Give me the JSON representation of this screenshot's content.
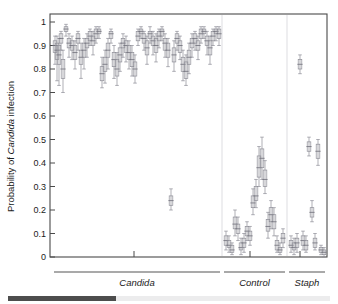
{
  "figure": {
    "axis": {
      "ylabel_prefix": "Probability of ",
      "ylabel_italic": "Candida",
      "ylabel_suffix": " infection",
      "yticks": [
        "1",
        "0.9",
        "0.8",
        "0.7",
        "0.6",
        "0.5",
        "0.4",
        "0.3",
        "0.2",
        "0.1",
        "0"
      ]
    },
    "groups": [
      {
        "name": "Candida",
        "label": "Candida"
      },
      {
        "name": "Control",
        "label": "Control"
      },
      {
        "name": "Staph",
        "label": "Staph"
      }
    ]
  },
  "chart_data": {
    "type": "scatter",
    "title": "",
    "xlabel": "",
    "ylabel": "Probability of Candida infection",
    "ylim": [
      0,
      1
    ],
    "yticks": [
      0,
      0.1,
      0.2,
      0.3,
      0.4,
      0.5,
      0.6,
      0.7,
      0.8,
      0.9,
      1
    ],
    "grid": false,
    "legend": "none",
    "marker_style": "box-and-whisker (median with 95% credible interval)",
    "group_separators_x": [
      222,
      287
    ],
    "groups": [
      {
        "name": "Candida",
        "label": "Candida",
        "n": 95,
        "x_start": 54,
        "x_end": 220,
        "series": [
          {
            "x": 55,
            "median": 0.9,
            "lo": 0.82,
            "hi": 0.94,
            "q1": 0.87,
            "q3": 0.92
          },
          {
            "x": 57,
            "median": 0.88,
            "lo": 0.75,
            "hi": 0.94,
            "q1": 0.84,
            "q3": 0.91
          },
          {
            "x": 59,
            "median": 0.86,
            "lo": 0.73,
            "hi": 0.93,
            "q1": 0.82,
            "q3": 0.9
          },
          {
            "x": 61,
            "median": 0.93,
            "lo": 0.88,
            "hi": 0.96,
            "q1": 0.91,
            "q3": 0.95
          },
          {
            "x": 63,
            "median": 0.8,
            "lo": 0.7,
            "hi": 0.88,
            "q1": 0.76,
            "q3": 0.84
          },
          {
            "x": 66,
            "median": 0.97,
            "lo": 0.94,
            "hi": 0.99,
            "q1": 0.96,
            "q3": 0.98
          },
          {
            "x": 69,
            "median": 0.91,
            "lo": 0.85,
            "hi": 0.95,
            "q1": 0.89,
            "q3": 0.93
          },
          {
            "x": 72,
            "median": 0.9,
            "lo": 0.84,
            "hi": 0.94,
            "q1": 0.88,
            "q3": 0.92
          },
          {
            "x": 75,
            "median": 0.87,
            "lo": 0.8,
            "hi": 0.92,
            "q1": 0.84,
            "q3": 0.9
          },
          {
            "x": 78,
            "median": 0.93,
            "lo": 0.88,
            "hi": 0.96,
            "q1": 0.91,
            "q3": 0.95
          },
          {
            "x": 81,
            "median": 0.85,
            "lo": 0.76,
            "hi": 0.91,
            "q1": 0.82,
            "q3": 0.88
          },
          {
            "x": 84,
            "median": 0.88,
            "lo": 0.8,
            "hi": 0.93,
            "q1": 0.85,
            "q3": 0.91
          },
          {
            "x": 87,
            "median": 0.91,
            "lo": 0.85,
            "hi": 0.95,
            "q1": 0.89,
            "q3": 0.93
          },
          {
            "x": 90,
            "median": 0.94,
            "lo": 0.9,
            "hi": 0.97,
            "q1": 0.92,
            "q3": 0.96
          },
          {
            "x": 93,
            "median": 0.92,
            "lo": 0.86,
            "hi": 0.96,
            "q1": 0.9,
            "q3": 0.94
          },
          {
            "x": 96,
            "median": 0.95,
            "lo": 0.91,
            "hi": 0.98,
            "q1": 0.93,
            "q3": 0.97
          },
          {
            "x": 99,
            "median": 0.96,
            "lo": 0.93,
            "hi": 0.98,
            "q1": 0.95,
            "q3": 0.97
          },
          {
            "x": 102,
            "median": 0.78,
            "lo": 0.72,
            "hi": 0.85,
            "q1": 0.75,
            "q3": 0.81
          },
          {
            "x": 105,
            "median": 0.82,
            "lo": 0.74,
            "hi": 0.88,
            "q1": 0.79,
            "q3": 0.85
          },
          {
            "x": 108,
            "median": 0.88,
            "lo": 0.8,
            "hi": 0.93,
            "q1": 0.85,
            "q3": 0.91
          },
          {
            "x": 111,
            "median": 0.95,
            "lo": 0.91,
            "hi": 0.97,
            "q1": 0.93,
            "q3": 0.96
          },
          {
            "x": 114,
            "median": 0.84,
            "lo": 0.76,
            "hi": 0.9,
            "q1": 0.81,
            "q3": 0.87
          },
          {
            "x": 117,
            "median": 0.8,
            "lo": 0.73,
            "hi": 0.87,
            "q1": 0.77,
            "q3": 0.84
          },
          {
            "x": 120,
            "median": 0.86,
            "lo": 0.79,
            "hi": 0.91,
            "q1": 0.83,
            "q3": 0.89
          },
          {
            "x": 123,
            "median": 0.91,
            "lo": 0.85,
            "hi": 0.95,
            "q1": 0.89,
            "q3": 0.93
          },
          {
            "x": 126,
            "median": 0.9,
            "lo": 0.83,
            "hi": 0.94,
            "q1": 0.87,
            "q3": 0.92
          },
          {
            "x": 129,
            "median": 0.87,
            "lo": 0.8,
            "hi": 0.92,
            "q1": 0.84,
            "q3": 0.9
          },
          {
            "x": 132,
            "median": 0.84,
            "lo": 0.77,
            "hi": 0.9,
            "q1": 0.81,
            "q3": 0.87
          },
          {
            "x": 135,
            "median": 0.8,
            "lo": 0.74,
            "hi": 0.86,
            "q1": 0.77,
            "q3": 0.83
          },
          {
            "x": 138,
            "median": 0.94,
            "lo": 0.9,
            "hi": 0.97,
            "q1": 0.92,
            "q3": 0.96
          },
          {
            "x": 141,
            "median": 0.96,
            "lo": 0.93,
            "hi": 0.98,
            "q1": 0.95,
            "q3": 0.97
          },
          {
            "x": 144,
            "median": 0.93,
            "lo": 0.88,
            "hi": 0.96,
            "q1": 0.91,
            "q3": 0.95
          },
          {
            "x": 147,
            "median": 0.89,
            "lo": 0.82,
            "hi": 0.94,
            "q1": 0.86,
            "q3": 0.92
          },
          {
            "x": 150,
            "median": 0.95,
            "lo": 0.91,
            "hi": 0.98,
            "q1": 0.93,
            "q3": 0.96
          },
          {
            "x": 153,
            "median": 0.92,
            "lo": 0.86,
            "hi": 0.96,
            "q1": 0.9,
            "q3": 0.94
          },
          {
            "x": 156,
            "median": 0.9,
            "lo": 0.83,
            "hi": 0.95,
            "q1": 0.87,
            "q3": 0.93
          },
          {
            "x": 159,
            "median": 0.94,
            "lo": 0.89,
            "hi": 0.97,
            "q1": 0.92,
            "q3": 0.96
          },
          {
            "x": 162,
            "median": 0.96,
            "lo": 0.92,
            "hi": 0.98,
            "q1": 0.94,
            "q3": 0.97
          },
          {
            "x": 165,
            "median": 0.91,
            "lo": 0.85,
            "hi": 0.95,
            "q1": 0.88,
            "q3": 0.93
          },
          {
            "x": 168,
            "median": 0.88,
            "lo": 0.81,
            "hi": 0.93,
            "q1": 0.85,
            "q3": 0.91
          },
          {
            "x": 171,
            "median": 0.24,
            "lo": 0.2,
            "hi": 0.29,
            "q1": 0.22,
            "q3": 0.26
          },
          {
            "x": 174,
            "median": 0.86,
            "lo": 0.79,
            "hi": 0.92,
            "q1": 0.83,
            "q3": 0.89
          },
          {
            "x": 177,
            "median": 0.93,
            "lo": 0.88,
            "hi": 0.96,
            "q1": 0.91,
            "q3": 0.95
          },
          {
            "x": 180,
            "median": 0.9,
            "lo": 0.84,
            "hi": 0.94,
            "q1": 0.87,
            "q3": 0.92
          },
          {
            "x": 183,
            "median": 0.82,
            "lo": 0.75,
            "hi": 0.88,
            "q1": 0.79,
            "q3": 0.85
          },
          {
            "x": 186,
            "median": 0.79,
            "lo": 0.73,
            "hi": 0.86,
            "q1": 0.76,
            "q3": 0.83
          },
          {
            "x": 189,
            "median": 0.85,
            "lo": 0.78,
            "hi": 0.91,
            "q1": 0.82,
            "q3": 0.88
          },
          {
            "x": 192,
            "median": 0.91,
            "lo": 0.85,
            "hi": 0.95,
            "q1": 0.89,
            "q3": 0.93
          },
          {
            "x": 195,
            "median": 0.93,
            "lo": 0.88,
            "hi": 0.96,
            "q1": 0.91,
            "q3": 0.95
          },
          {
            "x": 198,
            "median": 0.9,
            "lo": 0.84,
            "hi": 0.94,
            "q1": 0.88,
            "q3": 0.92
          },
          {
            "x": 201,
            "median": 0.95,
            "lo": 0.91,
            "hi": 0.98,
            "q1": 0.93,
            "q3": 0.97
          },
          {
            "x": 204,
            "median": 0.96,
            "lo": 0.93,
            "hi": 0.98,
            "q1": 0.95,
            "q3": 0.97
          },
          {
            "x": 207,
            "median": 0.92,
            "lo": 0.86,
            "hi": 0.96,
            "q1": 0.9,
            "q3": 0.94
          },
          {
            "x": 210,
            "median": 0.89,
            "lo": 0.82,
            "hi": 0.94,
            "q1": 0.86,
            "q3": 0.92
          },
          {
            "x": 213,
            "median": 0.94,
            "lo": 0.9,
            "hi": 0.97,
            "q1": 0.92,
            "q3": 0.96
          },
          {
            "x": 216,
            "median": 0.96,
            "lo": 0.92,
            "hi": 0.98,
            "q1": 0.95,
            "q3": 0.97
          },
          {
            "x": 219,
            "median": 0.95,
            "lo": 0.9,
            "hi": 0.98,
            "q1": 0.93,
            "q3": 0.97
          }
        ]
      },
      {
        "name": "Control",
        "label": "Control",
        "n": 30,
        "x_start": 224,
        "x_end": 285,
        "series": [
          {
            "x": 226,
            "median": 0.07,
            "lo": 0.03,
            "hi": 0.11,
            "q1": 0.05,
            "q3": 0.09
          },
          {
            "x": 229,
            "median": 0.05,
            "lo": 0.02,
            "hi": 0.09,
            "q1": 0.04,
            "q3": 0.07
          },
          {
            "x": 232,
            "median": 0.03,
            "lo": 0.01,
            "hi": 0.06,
            "q1": 0.02,
            "q3": 0.05
          },
          {
            "x": 235,
            "median": 0.14,
            "lo": 0.09,
            "hi": 0.2,
            "q1": 0.12,
            "q3": 0.17
          },
          {
            "x": 238,
            "median": 0.12,
            "lo": 0.07,
            "hi": 0.17,
            "q1": 0.1,
            "q3": 0.14
          },
          {
            "x": 241,
            "median": 0.04,
            "lo": 0.01,
            "hi": 0.08,
            "q1": 0.03,
            "q3": 0.06
          },
          {
            "x": 244,
            "median": 0.06,
            "lo": 0.02,
            "hi": 0.1,
            "q1": 0.04,
            "q3": 0.08
          },
          {
            "x": 247,
            "median": 0.11,
            "lo": 0.07,
            "hi": 0.15,
            "q1": 0.09,
            "q3": 0.13
          },
          {
            "x": 250,
            "median": 0.09,
            "lo": 0.05,
            "hi": 0.13,
            "q1": 0.07,
            "q3": 0.11
          },
          {
            "x": 253,
            "median": 0.23,
            "lo": 0.18,
            "hi": 0.29,
            "q1": 0.21,
            "q3": 0.26
          },
          {
            "x": 256,
            "median": 0.26,
            "lo": 0.21,
            "hi": 0.33,
            "q1": 0.24,
            "q3": 0.3
          },
          {
            "x": 259,
            "median": 0.38,
            "lo": 0.3,
            "hi": 0.47,
            "q1": 0.34,
            "q3": 0.43
          },
          {
            "x": 262,
            "median": 0.42,
            "lo": 0.33,
            "hi": 0.51,
            "q1": 0.38,
            "q3": 0.46
          },
          {
            "x": 265,
            "median": 0.33,
            "lo": 0.27,
            "hi": 0.41,
            "q1": 0.3,
            "q3": 0.37
          },
          {
            "x": 268,
            "median": 0.13,
            "lo": 0.08,
            "hi": 0.19,
            "q1": 0.11,
            "q3": 0.16
          },
          {
            "x": 271,
            "median": 0.18,
            "lo": 0.12,
            "hi": 0.24,
            "q1": 0.15,
            "q3": 0.21
          },
          {
            "x": 274,
            "median": 0.15,
            "lo": 0.09,
            "hi": 0.21,
            "q1": 0.12,
            "q3": 0.18
          },
          {
            "x": 277,
            "median": 0.05,
            "lo": 0.02,
            "hi": 0.09,
            "q1": 0.03,
            "q3": 0.07
          },
          {
            "x": 280,
            "median": 0.03,
            "lo": 0.01,
            "hi": 0.06,
            "q1": 0.02,
            "q3": 0.04
          },
          {
            "x": 283,
            "median": 0.08,
            "lo": 0.04,
            "hi": 0.12,
            "q1": 0.06,
            "q3": 0.1
          }
        ]
      },
      {
        "name": "Staph",
        "label": "Staph",
        "n": 12,
        "x_start": 289,
        "x_end": 325,
        "series": [
          {
            "x": 291,
            "median": 0.05,
            "lo": 0.02,
            "hi": 0.09,
            "q1": 0.04,
            "q3": 0.07
          },
          {
            "x": 294,
            "median": 0.04,
            "lo": 0.01,
            "hi": 0.08,
            "q1": 0.03,
            "q3": 0.06
          },
          {
            "x": 297,
            "median": 0.06,
            "lo": 0.02,
            "hi": 0.1,
            "q1": 0.04,
            "q3": 0.08
          },
          {
            "x": 300,
            "median": 0.82,
            "lo": 0.78,
            "hi": 0.86,
            "q1": 0.8,
            "q3": 0.84
          },
          {
            "x": 303,
            "median": 0.07,
            "lo": 0.03,
            "hi": 0.11,
            "q1": 0.05,
            "q3": 0.09
          },
          {
            "x": 306,
            "median": 0.05,
            "lo": 0.02,
            "hi": 0.09,
            "q1": 0.03,
            "q3": 0.07
          },
          {
            "x": 309,
            "median": 0.47,
            "lo": 0.43,
            "hi": 0.51,
            "q1": 0.45,
            "q3": 0.49
          },
          {
            "x": 312,
            "median": 0.19,
            "lo": 0.15,
            "hi": 0.24,
            "q1": 0.17,
            "q3": 0.21
          },
          {
            "x": 315,
            "median": 0.06,
            "lo": 0.03,
            "hi": 0.1,
            "q1": 0.04,
            "q3": 0.08
          },
          {
            "x": 318,
            "median": 0.45,
            "lo": 0.39,
            "hi": 0.5,
            "q1": 0.42,
            "q3": 0.48
          },
          {
            "x": 321,
            "median": 0.03,
            "lo": 0.01,
            "hi": 0.05,
            "q1": 0.02,
            "q3": 0.04
          },
          {
            "x": 324,
            "median": 0.02,
            "lo": 0.0,
            "hi": 0.04,
            "q1": 0.01,
            "q3": 0.03
          }
        ]
      }
    ]
  }
}
